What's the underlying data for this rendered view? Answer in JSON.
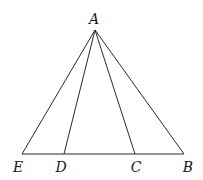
{
  "diagram": {
    "title": "",
    "points": {
      "A": {
        "label": "A",
        "x": 95,
        "y": 30,
        "lx": 94,
        "ly": 24
      },
      "E": {
        "label": "E",
        "x": 22,
        "y": 154,
        "lx": 18,
        "ly": 172
      },
      "D": {
        "label": "D",
        "x": 64,
        "y": 154,
        "lx": 61,
        "ly": 172
      },
      "C": {
        "label": "C",
        "x": 135,
        "y": 154,
        "lx": 136,
        "ly": 172
      },
      "B": {
        "label": "B",
        "x": 184,
        "y": 154,
        "lx": 188,
        "ly": 172
      }
    },
    "segments": [
      [
        "A",
        "E"
      ],
      [
        "A",
        "D"
      ],
      [
        "A",
        "C"
      ],
      [
        "A",
        "B"
      ],
      [
        "E",
        "B"
      ]
    ],
    "stroke_color": "#2a2a2a"
  }
}
